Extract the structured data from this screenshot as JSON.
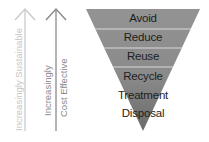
{
  "diagram": {
    "arrows": [
      {
        "label": "Increasingly Sustainable",
        "color": "#c8c8c8"
      },
      {
        "label_line1": "Increasingly",
        "label_line2": "Cost Effective",
        "color": "#8a8a8a"
      }
    ],
    "levels": [
      {
        "label": "Avoid"
      },
      {
        "label": "Reduce"
      },
      {
        "label": "Reuse"
      },
      {
        "label": "Recycle"
      },
      {
        "label": "Treatment"
      },
      {
        "label": "Disposal"
      }
    ],
    "colors": {
      "triangle_top": "#8f8f8f",
      "triangle_bottom": "#6c6c6c",
      "divider": "#d9d9d9",
      "text": "#1e1e1e"
    }
  }
}
